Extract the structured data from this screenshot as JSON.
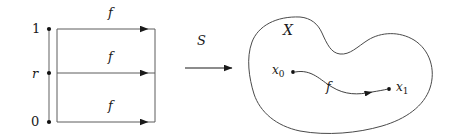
{
  "figure": {
    "kind": "mathematical-diagram",
    "width": 450,
    "height": 140,
    "background": "#ffffff",
    "stroke_color": "#3a3a3a",
    "text_color": "#1a1a1a"
  },
  "interval": {
    "name": "unit-interval",
    "top_label": "1",
    "mid_label": "r",
    "bottom_label": "0",
    "endpoints": [
      {
        "label": "1",
        "x": 36,
        "y": 29
      },
      {
        "label": "r",
        "x": 36,
        "y": 73
      },
      {
        "label": "0",
        "x": 36,
        "y": 122
      }
    ]
  },
  "square": {
    "name": "homotopy-square",
    "left": 57,
    "right": 155,
    "top": 29,
    "bottom": 122,
    "divider_y": 73,
    "arrows": [
      {
        "label": "f",
        "y": 29,
        "label_x": 112,
        "label_y": 13
      },
      {
        "label": "f",
        "y": 73,
        "label_x": 112,
        "label_y": 57
      },
      {
        "label": "f",
        "y": 122,
        "label_x": 112,
        "label_y": 106
      }
    ]
  },
  "map_arrow": {
    "name": "map-S",
    "label": "S",
    "label_x": 200,
    "label_y": 41,
    "x_start": 185,
    "x_end": 232,
    "y": 68
  },
  "space": {
    "name": "space-X",
    "label": "X",
    "label_x": 286,
    "label_y": 31,
    "path": {
      "name": "path-f",
      "label": "f",
      "label_x": 328,
      "label_y": 86,
      "start_point": {
        "label": "x",
        "subscript": "0",
        "label_x": 272,
        "label_y": 66,
        "dot_x": 293,
        "dot_y": 72
      },
      "end_point": {
        "label": "x",
        "subscript": "1",
        "label_x": 396,
        "label_y": 83,
        "dot_x": 389,
        "dot_y": 89
      }
    }
  }
}
